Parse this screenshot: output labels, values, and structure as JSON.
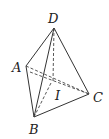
{
  "diagram": {
    "type": "tetrahedron",
    "stroke_color": "#333333",
    "background": "#ffffff",
    "vertices": {
      "D": {
        "label": "D",
        "x": 54,
        "y": 28
      },
      "A": {
        "label": "A",
        "x": 26,
        "y": 66
      },
      "C": {
        "label": "C",
        "x": 89,
        "y": 94
      },
      "B": {
        "label": "B",
        "x": 34,
        "y": 117
      },
      "I": {
        "label": "I",
        "x": 51,
        "y": 83
      }
    },
    "solid_edges": [
      [
        "D",
        "A"
      ],
      [
        "D",
        "B"
      ],
      [
        "D",
        "C"
      ],
      [
        "A",
        "B"
      ],
      [
        "B",
        "C"
      ]
    ],
    "dashed_edges": [
      [
        "A",
        "C"
      ],
      [
        "A",
        "C2"
      ],
      [
        "D",
        "I"
      ],
      [
        "B",
        "I"
      ]
    ]
  }
}
